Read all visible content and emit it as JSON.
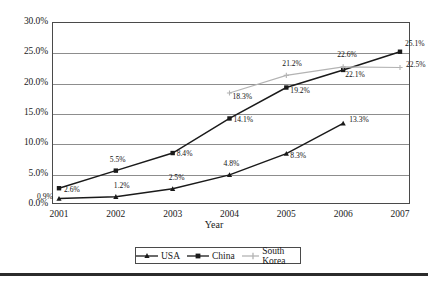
{
  "chart_data": {
    "type": "line",
    "title": "",
    "xlabel": "Year",
    "ylabel": "",
    "categories": [
      "2001",
      "2002",
      "2003",
      "2004",
      "2005",
      "2006",
      "2007"
    ],
    "ylim": [
      0,
      30
    ],
    "ytick_labels": [
      "0.0%",
      "5.0%",
      "10.0%",
      "15.0%",
      "20.0%",
      "25.0%",
      "30.0%"
    ],
    "ytick_values": [
      0,
      5,
      10,
      15,
      20,
      25,
      30
    ],
    "grid": true,
    "legend_position": "bottom",
    "series": [
      {
        "name": "USA",
        "color": "#1a1a1a",
        "marker": "triangle",
        "x": [
          "2001",
          "2002",
          "2003",
          "2004",
          "2005",
          "2006"
        ],
        "values": [
          0.9,
          1.2,
          2.5,
          4.8,
          8.3,
          13.3
        ],
        "labels": [
          "0.9%",
          "1.2%",
          "2.5%",
          "4.8%",
          "8.3%",
          "13.3%"
        ]
      },
      {
        "name": "China",
        "color": "#1a1a1a",
        "marker": "square",
        "x": [
          "2001",
          "2002",
          "2003",
          "2004",
          "2005",
          "2006",
          "2007"
        ],
        "values": [
          2.6,
          5.5,
          8.4,
          14.1,
          19.2,
          22.1,
          25.1
        ],
        "labels": [
          "2.6%",
          "5.5%",
          "8.4%",
          "14.1%",
          "19.2%",
          "22.1%",
          "25.1%"
        ]
      },
      {
        "name": "South Korea",
        "color": "#b3b3b3",
        "marker": "cross",
        "x": [
          "2004",
          "2005",
          "2006",
          "2007"
        ],
        "values": [
          18.3,
          21.2,
          22.6,
          22.5
        ],
        "labels": [
          "18.3%",
          "21.2%",
          "22.6%",
          "22.5%"
        ]
      }
    ]
  },
  "legend": {
    "items": [
      {
        "label": "USA"
      },
      {
        "label": "China"
      },
      {
        "label": "South Korea"
      }
    ]
  },
  "axes": {
    "x_title": "Year"
  }
}
